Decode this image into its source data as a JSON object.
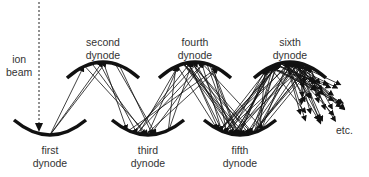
{
  "diagram": {
    "ion_beam": {
      "label_line1": "ion",
      "label_line2": "beam"
    },
    "dynodes": [
      {
        "id": "first",
        "line1": "first",
        "line2": "dynode",
        "position": "bottom"
      },
      {
        "id": "second",
        "line1": "second",
        "line2": "dynode",
        "position": "top"
      },
      {
        "id": "third",
        "line1": "third",
        "line2": "dynode",
        "position": "bottom"
      },
      {
        "id": "fourth",
        "line1": "fourth",
        "line2": "dynode",
        "position": "top"
      },
      {
        "id": "fifth",
        "line1": "fifth",
        "line2": "dynode",
        "position": "bottom"
      },
      {
        "id": "sixth",
        "line1": "sixth",
        "line2": "dynode",
        "position": "top"
      }
    ],
    "continuation_label": "etc.",
    "colors": {
      "stroke": "#111111",
      "text": "#333333",
      "background": "#ffffff"
    }
  }
}
